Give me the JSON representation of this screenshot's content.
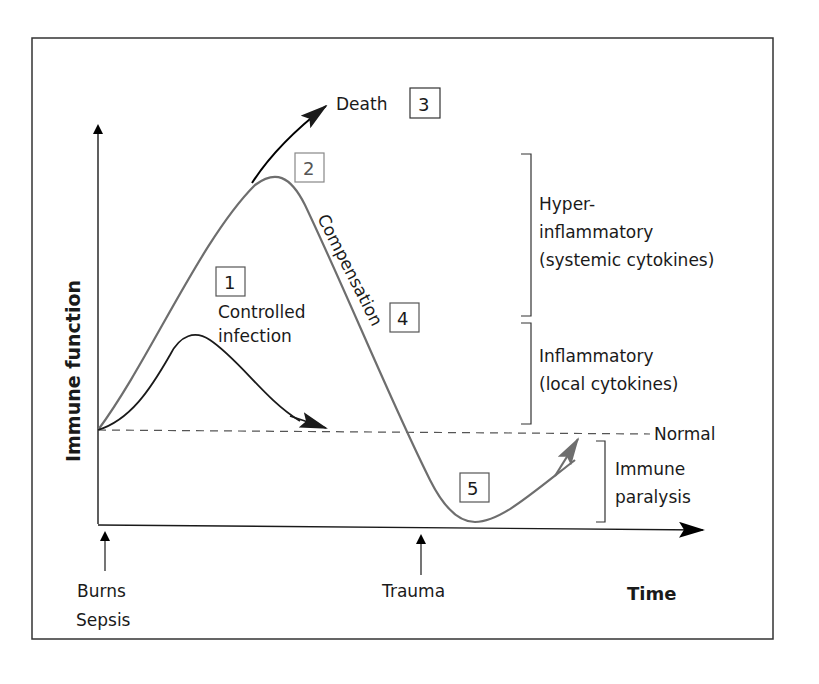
{
  "figure": {
    "y_axis_label": "Immune function",
    "x_axis_label": "Time",
    "normal_label": "Normal",
    "death_label": "Death",
    "controlled_infection_label": [
      "Controlled",
      "infection"
    ],
    "compensation_label": "Compensation",
    "event_labels": {
      "burns_sepsis": [
        "Burns",
        "Sepsis"
      ],
      "trauma": "Trauma"
    },
    "brackets": [
      {
        "lines": [
          "Hyper-",
          "inflammatory",
          "(systemic cytokines)"
        ]
      },
      {
        "lines": [
          "Inflammatory",
          "(local cytokines)"
        ]
      },
      {
        "lines": [
          "Immune",
          "paralysis"
        ]
      }
    ],
    "markers": [
      "1",
      "2",
      "3",
      "4",
      "5"
    ],
    "colors": {
      "main_curve": "#6e6e6e",
      "controlled_curve": "#1a1a1a",
      "death_arrow": "#000000",
      "recovery_arrow": "#6e6e6e",
      "frame": "#333333",
      "normal_line": "#555555"
    }
  }
}
